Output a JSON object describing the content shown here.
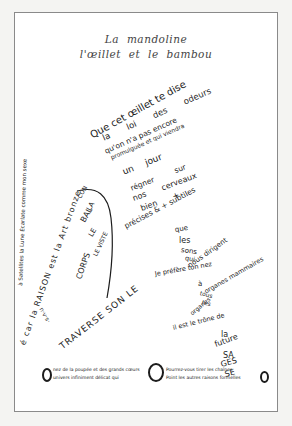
{
  "title": {
    "line1": "La mandoline",
    "line2": "l'œillet et le bambou"
  },
  "carnation": {
    "lines": [
      "Que cet œillet te dise",
      "la loi des odeurs",
      "qu'on n'a pas encore",
      "promulguée et qui viendra",
      "un jour",
      "régner sur",
      "nos cerveaux",
      "bien +",
      "précises & + subtiles",
      "que",
      "les",
      "sons",
      "qui",
      "nous dirigent"
    ],
    "branch_left": "Je préfère ton nez",
    "branch_right": "organes mammaires",
    "stem_words": [
      "à",
      "tous",
      "tes",
      "organes"
    ],
    "future_line": "il est le trône de",
    "future_words": [
      "la",
      "future",
      "SA",
      "GES",
      "SE"
    ]
  },
  "mandolin": {
    "outer_arc": "é car la RAISON est la Art bronze",
    "inner_vertical": "à Satellites la Lune Écarlate comme mon sexe",
    "inner_words": [
      "CON",
      "BAL",
      "LA",
      "BAL",
      "LE",
      "CORPS",
      "LE VISTE"
    ],
    "bottom_arc": "TRAVERSE SON LE",
    "bottom_dots": "n·v·s·"
  },
  "bamboo": {
    "left_line1": "nez de la poupée et des grands cœurs",
    "left_line2": "univers infiniment délicat qui",
    "right_line1": "Pourrez-vous tirer les chaînes",
    "right_line2": "Point les autres raisons formelles",
    "o_letter": "O"
  }
}
